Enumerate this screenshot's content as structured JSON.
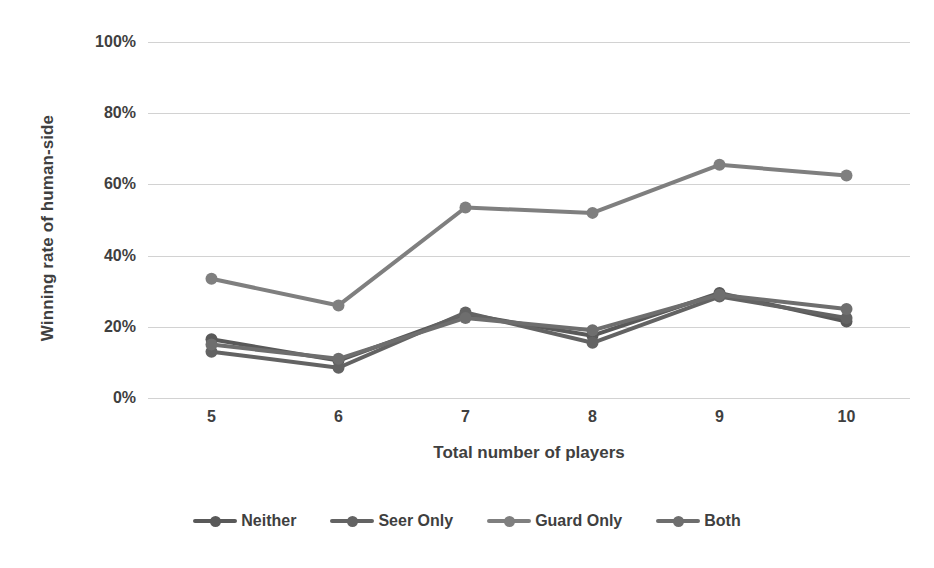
{
  "chart_data": {
    "type": "line",
    "title": "",
    "xlabel": "Total number of players",
    "ylabel": "Winning rate of human-side",
    "categories": [
      5,
      6,
      7,
      8,
      9,
      10
    ],
    "x_tick_labels": [
      "5",
      "6",
      "7",
      "8",
      "9",
      "10"
    ],
    "y_tick_labels": [
      "0%",
      "20%",
      "40%",
      "60%",
      "80%",
      "100%"
    ],
    "y_tick_values": [
      0,
      20,
      40,
      60,
      80,
      100
    ],
    "ylim": [
      0,
      100
    ],
    "grid": "horizontal",
    "legend_position": "bottom",
    "series": [
      {
        "name": "Neither",
        "color": "#595959",
        "values": [
          16.5,
          10.5,
          23.5,
          17.5,
          29.5,
          21.5
        ]
      },
      {
        "name": "Seer Only",
        "color": "#636363",
        "values": [
          13.0,
          8.5,
          24.0,
          15.5,
          28.5,
          22.5
        ]
      },
      {
        "name": "Guard Only",
        "color": "#7f7f7f",
        "values": [
          33.5,
          26.0,
          53.5,
          52.0,
          65.5,
          62.5
        ]
      },
      {
        "name": "Both",
        "color": "#6e6e6e",
        "values": [
          15.0,
          11.0,
          22.5,
          19.0,
          29.0,
          25.0
        ]
      }
    ]
  },
  "legend": {
    "items": [
      {
        "label": "Neither"
      },
      {
        "label": "Seer Only"
      },
      {
        "label": "Guard Only"
      },
      {
        "label": "Both"
      }
    ]
  },
  "colors": {
    "gridline": "#d2d2d2",
    "text": "#3f3f3f",
    "background": "#ffffff"
  }
}
